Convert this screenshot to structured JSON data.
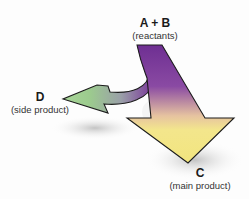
{
  "diagram": {
    "nodes": {
      "reactants": {
        "symbol": "A + B",
        "caption": "(reactants)"
      },
      "side_product": {
        "symbol": "D",
        "caption": "(side product)"
      },
      "main_product": {
        "symbol": "C",
        "caption": "(main product)"
      }
    },
    "arrows": [
      {
        "from": "reactants",
        "to": "main_product",
        "role": "main pathway",
        "colors": [
          "#7b3a9a",
          "#f0e88a"
        ]
      },
      {
        "from": "reactants",
        "to": "side_product",
        "role": "side pathway",
        "colors": [
          "#7b3a9a",
          "#9fcf8f"
        ]
      }
    ]
  }
}
